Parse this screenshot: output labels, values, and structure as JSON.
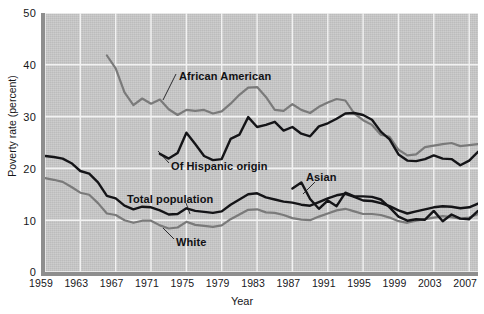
{
  "axes": {
    "xlabel": "Year",
    "ylabel": "Poverty rate (percent)",
    "yticks": [
      "50",
      "40",
      "30",
      "20",
      "10",
      "0"
    ],
    "xticks": [
      "1959",
      "1963",
      "1967",
      "1971",
      "1975",
      "1979",
      "1983",
      "1987",
      "1991",
      "1995",
      "1999",
      "2003",
      "2007"
    ]
  },
  "annotations": {
    "african_american": "African American",
    "hispanic": "Of Hispanic origin",
    "total_population": "Total population",
    "white": "White",
    "asian": "Asian"
  },
  "colors": {
    "plot_background": "#c9c9c9",
    "axis": "#8e8e8e",
    "gridline": "#f2f2f2",
    "dark_series": "#141417",
    "gray_series": "#7a7a7a",
    "text": "#17171a"
  },
  "chart_data": {
    "type": "line",
    "title": "",
    "xlabel": "Year",
    "ylabel": "Poverty rate (percent)",
    "xlim": [
      1959,
      2008
    ],
    "ylim": [
      0,
      50
    ],
    "ytick_step": 10,
    "xtick_step": 4,
    "grid": true,
    "legend_position": "inline-annotations",
    "series": [
      {
        "name": "African American",
        "color": "#7a7a7a",
        "x": [
          1966,
          1967,
          1968,
          1969,
          1970,
          1971,
          1972,
          1973,
          1974,
          1975,
          1976,
          1977,
          1978,
          1979,
          1980,
          1981,
          1982,
          1983,
          1984,
          1985,
          1986,
          1987,
          1988,
          1989,
          1990,
          1991,
          1992,
          1993,
          1994,
          1995,
          1996,
          1997,
          1998,
          1999,
          2000,
          2001,
          2002,
          2003,
          2004,
          2005,
          2006,
          2007,
          2008
        ],
        "values": [
          41.8,
          39.3,
          34.7,
          32.2,
          33.5,
          32.5,
          33.3,
          31.4,
          30.3,
          31.3,
          31.1,
          31.3,
          30.6,
          31.0,
          32.5,
          34.2,
          35.6,
          35.7,
          33.8,
          31.3,
          31.1,
          32.4,
          31.3,
          30.7,
          31.9,
          32.7,
          33.4,
          33.1,
          30.6,
          29.3,
          28.4,
          26.5,
          26.1,
          23.6,
          22.5,
          22.7,
          24.1,
          24.4,
          24.7,
          24.9,
          24.3,
          24.5,
          24.7
        ]
      },
      {
        "name": "Of Hispanic origin",
        "color": "#141417",
        "x": [
          1972,
          1973,
          1974,
          1975,
          1976,
          1977,
          1978,
          1979,
          1980,
          1981,
          1982,
          1983,
          1984,
          1985,
          1986,
          1987,
          1988,
          1989,
          1990,
          1991,
          1992,
          1993,
          1994,
          1995,
          1996,
          1997,
          1998,
          1999,
          2000,
          2001,
          2002,
          2003,
          2004,
          2005,
          2006,
          2007,
          2008
        ],
        "values": [
          22.8,
          21.9,
          23.0,
          26.9,
          24.7,
          22.4,
          21.6,
          21.8,
          25.7,
          26.5,
          29.9,
          28.0,
          28.4,
          29.0,
          27.3,
          28.0,
          26.7,
          26.2,
          28.1,
          28.7,
          29.6,
          30.6,
          30.7,
          30.3,
          29.4,
          27.1,
          25.6,
          22.7,
          21.5,
          21.4,
          21.8,
          22.5,
          21.9,
          21.8,
          20.6,
          21.5,
          23.2
        ]
      },
      {
        "name": "Total population",
        "color": "#141417",
        "x": [
          1959,
          1960,
          1961,
          1962,
          1963,
          1964,
          1965,
          1966,
          1967,
          1968,
          1969,
          1970,
          1971,
          1972,
          1973,
          1974,
          1975,
          1976,
          1977,
          1978,
          1979,
          1980,
          1981,
          1982,
          1983,
          1984,
          1985,
          1986,
          1987,
          1988,
          1989,
          1990,
          1991,
          1992,
          1993,
          1994,
          1995,
          1996,
          1997,
          1998,
          1999,
          2000,
          2001,
          2002,
          2003,
          2004,
          2005,
          2006,
          2007,
          2008
        ],
        "values": [
          22.4,
          22.2,
          21.9,
          21.0,
          19.5,
          19.0,
          17.3,
          14.7,
          14.2,
          12.8,
          12.1,
          12.6,
          12.5,
          11.9,
          11.1,
          11.2,
          12.3,
          11.8,
          11.6,
          11.4,
          11.7,
          13.0,
          14.0,
          15.0,
          15.2,
          14.4,
          14.0,
          13.6,
          13.4,
          13.0,
          12.8,
          13.5,
          14.2,
          14.8,
          15.1,
          14.5,
          13.8,
          13.7,
          13.3,
          12.7,
          11.9,
          11.3,
          11.7,
          12.1,
          12.5,
          12.7,
          12.6,
          12.3,
          12.5,
          13.2
        ]
      },
      {
        "name": "White",
        "color": "#7a7a7a",
        "x": [
          1959,
          1960,
          1961,
          1962,
          1963,
          1964,
          1965,
          1966,
          1967,
          1968,
          1969,
          1970,
          1971,
          1972,
          1973,
          1974,
          1975,
          1976,
          1977,
          1978,
          1979,
          1980,
          1981,
          1982,
          1983,
          1984,
          1985,
          1986,
          1987,
          1988,
          1989,
          1990,
          1991,
          1992,
          1993,
          1994,
          1995,
          1996,
          1997,
          1998,
          1999,
          2000,
          2001,
          2002,
          2003,
          2004,
          2005,
          2006,
          2007,
          2008
        ],
        "values": [
          18.1,
          17.8,
          17.4,
          16.4,
          15.3,
          14.9,
          13.3,
          11.3,
          11.0,
          10.0,
          9.5,
          9.9,
          9.9,
          9.0,
          8.4,
          8.6,
          9.7,
          9.1,
          8.9,
          8.7,
          9.0,
          10.2,
          11.1,
          12.0,
          12.1,
          11.5,
          11.4,
          11.0,
          10.4,
          10.1,
          10.0,
          10.7,
          11.3,
          11.9,
          12.2,
          11.7,
          11.2,
          11.2,
          11.0,
          10.5,
          9.8,
          9.5,
          9.9,
          10.2,
          10.5,
          10.8,
          10.6,
          10.3,
          10.5,
          11.2
        ]
      },
      {
        "name": "Asian",
        "color": "#141417",
        "x": [
          1987,
          1988,
          1989,
          1990,
          1991,
          1992,
          1993,
          1994,
          1995,
          1996,
          1997,
          1998,
          1999,
          2000,
          2001,
          2002,
          2003,
          2004,
          2005,
          2006,
          2007,
          2008
        ],
        "values": [
          16.1,
          17.3,
          14.1,
          12.2,
          13.8,
          12.7,
          15.3,
          14.6,
          14.6,
          14.5,
          14.0,
          12.5,
          10.7,
          9.9,
          10.2,
          10.1,
          11.8,
          9.8,
          11.1,
          10.3,
          10.2,
          11.8
        ]
      }
    ]
  }
}
